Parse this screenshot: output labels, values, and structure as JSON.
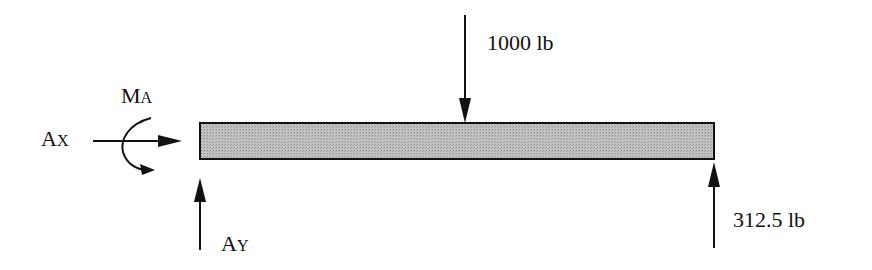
{
  "diagram": {
    "type": "free-body-diagram",
    "beam": {
      "fill": "#b8b8b8",
      "stroke": "#111111"
    },
    "labels": {
      "moment_main": "M",
      "moment_sub": "A",
      "ax_main": "A",
      "ax_sub": "X",
      "ay_main": "A",
      "ay_sub": "Y",
      "load": "1000 lb",
      "reaction_right": "312.5 lb"
    }
  }
}
